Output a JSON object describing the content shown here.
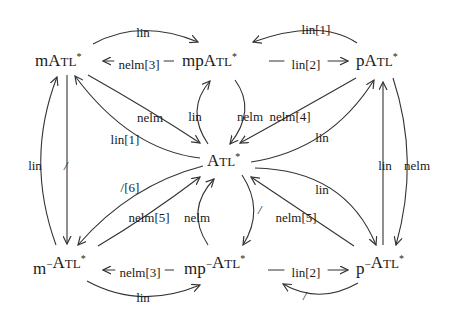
{
  "diagram": {
    "nodes": [
      {
        "id": "mATL",
        "prefix": "m",
        "sup": "",
        "main": "ATL",
        "star": "*"
      },
      {
        "id": "mpATL",
        "prefix": "mp",
        "sup": "",
        "main": "ATL",
        "star": "*"
      },
      {
        "id": "pATL",
        "prefix": "p",
        "sup": "",
        "main": "ATL",
        "star": "*"
      },
      {
        "id": "ATL",
        "prefix": "",
        "sup": "",
        "main": "ATL",
        "star": "*"
      },
      {
        "id": "mmATL",
        "prefix": "m",
        "sup": "−",
        "main": "ATL",
        "star": "*"
      },
      {
        "id": "mpmATL",
        "prefix": "mp",
        "sup": "−",
        "main": "ATL",
        "star": "*"
      },
      {
        "id": "pmATL",
        "prefix": "p",
        "sup": "−",
        "main": "ATL",
        "star": "*"
      }
    ],
    "edges": [
      {
        "from": "mATL",
        "to": "mpATL",
        "label": "lin"
      },
      {
        "from": "mpATL",
        "to": "mATL",
        "label": "nelm[3]"
      },
      {
        "from": "pATL",
        "to": "mpATL",
        "label": "lin[1]"
      },
      {
        "from": "mpATL",
        "to": "pATL",
        "label": "lin[2]"
      },
      {
        "from": "mATL",
        "to": "ATL",
        "label": "nelm"
      },
      {
        "from": "ATL",
        "to": "mATL",
        "label": "lin[1]"
      },
      {
        "from": "ATL",
        "to": "mpATL",
        "label": "lin"
      },
      {
        "from": "mpATL",
        "to": "ATL",
        "label": "nelm"
      },
      {
        "from": "pATL",
        "to": "ATL",
        "label": "nelm[4]"
      },
      {
        "from": "ATL",
        "to": "pATL",
        "label": "lin"
      },
      {
        "from": "mmATL",
        "to": "mATL",
        "label": "lin"
      },
      {
        "from": "mATL",
        "to": "mmATL",
        "label": "/"
      },
      {
        "from": "ATL",
        "to": "mmATL",
        "label": "/[6]"
      },
      {
        "from": "mmATL",
        "to": "ATL",
        "label": "nelm[5]"
      },
      {
        "from": "mpmATL",
        "to": "ATL",
        "label": "nelm"
      },
      {
        "from": "ATL",
        "to": "mpmATL",
        "label": "/"
      },
      {
        "from": "ATL",
        "to": "pmATL",
        "label": "lin"
      },
      {
        "from": "pmATL",
        "to": "ATL",
        "label": "nelm[5]"
      },
      {
        "from": "pmATL",
        "to": "pATL",
        "label": "lin"
      },
      {
        "from": "pATL",
        "to": "pmATL",
        "label": "nelm"
      },
      {
        "from": "mpmATL",
        "to": "mmATL",
        "label": "nelm[3]"
      },
      {
        "from": "mmATL",
        "to": "mpmATL",
        "label": "lin"
      },
      {
        "from": "mpmATL",
        "to": "pmATL",
        "label": "lin[2]"
      },
      {
        "from": "pmATL",
        "to": "mpmATL",
        "label": "/"
      }
    ]
  }
}
